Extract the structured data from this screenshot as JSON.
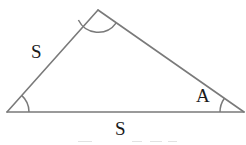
{
  "figure": {
    "background_color": "#ffffff",
    "stroke_color": "#7a7a7a",
    "stroke_width": 1.6,
    "label_color": "#1a1a1a",
    "vertices": {
      "apex": {
        "x": 98,
        "y": 10
      },
      "left": {
        "x": 7,
        "y": 112
      },
      "right": {
        "x": 244,
        "y": 112
      }
    },
    "edges": [
      {
        "name": "left-side",
        "from": "left",
        "to": "apex"
      },
      {
        "name": "right-side",
        "from": "apex",
        "to": "right"
      },
      {
        "name": "base",
        "from": "left",
        "to": "right"
      }
    ],
    "angle_arcs": [
      {
        "name": "apex-angle-arc",
        "vertex": "apex",
        "radius": 22
      },
      {
        "name": "left-angle-arc",
        "vertex": "left",
        "radius": 22
      },
      {
        "name": "right-angle-arc",
        "vertex": "right",
        "radius": 24
      }
    ],
    "labels": [
      {
        "name": "side-left",
        "text": "S",
        "x": 31,
        "y": 42
      },
      {
        "name": "angle-right",
        "text": "A",
        "x": 196,
        "y": 86
      },
      {
        "name": "side-base",
        "text": "S",
        "x": 115,
        "y": 119
      }
    ],
    "bottom_artifact_marks": [
      {
        "left": 78,
        "width": 14
      },
      {
        "left": 132,
        "width": 10
      },
      {
        "left": 150,
        "width": 12
      },
      {
        "left": 168,
        "width": 9
      }
    ]
  }
}
